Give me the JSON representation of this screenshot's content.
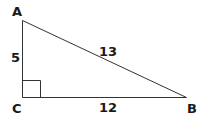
{
  "diagram": {
    "type": "right-triangle",
    "vertices": {
      "A": {
        "label": "A"
      },
      "B": {
        "label": "B"
      },
      "C": {
        "label": "C"
      }
    },
    "sides": {
      "AC": {
        "label": "5"
      },
      "AB": {
        "label": "13"
      },
      "CB": {
        "label": "12"
      }
    },
    "right_angle_at": "C",
    "stroke_color": "#333333"
  }
}
